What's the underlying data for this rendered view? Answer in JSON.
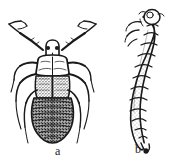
{
  "figure": {
    "kind": "scientific-illustration",
    "background_color": "#ffffff",
    "ink_color": "#1a1a1a",
    "width_px": 184,
    "height_px": 166,
    "panels": [
      {
        "id": "a",
        "label": "a",
        "label_x": 57,
        "label_y": 150,
        "view": "dorsal",
        "stage": "adult",
        "description": "dorsal view of an adult bug with long segmented antennae, six legs, shield-shaped pronotum, dark stippled wing pads and a broad oval transversely segmented abdomen"
      },
      {
        "id": "b",
        "label": "b",
        "label_x": 138,
        "label_y": 148,
        "view": "lateral",
        "stage": "larva",
        "description": "lateral view of a stippled grub-like larva, head capsule with short legs at upper right, body of swollen segments tapering to a pointed dark tail tip at lower right"
      }
    ]
  }
}
